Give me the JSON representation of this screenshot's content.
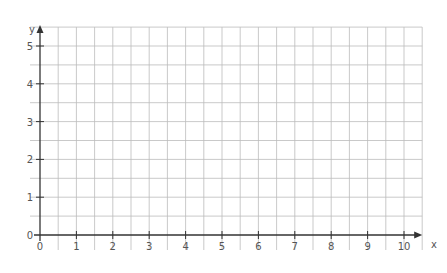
{
  "chart_data": {
    "type": "line",
    "title": "",
    "xlabel": "x",
    "ylabel": "y",
    "xlim": [
      0,
      10.5
    ],
    "ylim": [
      0,
      5.5
    ],
    "x_ticks": [
      "0",
      "1",
      "2",
      "3",
      "4",
      "5",
      "6",
      "7",
      "8",
      "9",
      "10"
    ],
    "y_ticks": [
      "0",
      "1",
      "2",
      "3",
      "4",
      "5"
    ],
    "grid": true,
    "minor_grid_step": 0.5,
    "series": [],
    "axis_color": "#333333",
    "grid_color": "#bbbbbb"
  }
}
